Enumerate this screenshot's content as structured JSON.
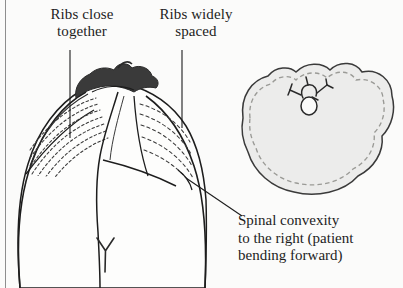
{
  "figure": {
    "kind": "medical-illustration",
    "background_color": "#fbfbfa",
    "ink_color": "#1d1d1d",
    "skin_fill": "#fdfdfc",
    "hair_color": "#3a3a3a",
    "inset_fill": "#ececeb",
    "dashed_line_color": "#9a9a96"
  },
  "labels": {
    "ribs_close": "Ribs close\ntogether",
    "ribs_wide": "Ribs widely\nspaced",
    "convexity": "Spinal convexity\nto the right (patient\nbending forward)"
  },
  "annotations": {
    "left_leader": "vertical leader line from 'Ribs close together' to left rib hump",
    "right_leader": "vertical leader line from 'Ribs widely spaced' to right flank ribs",
    "convexity_leader": "diagonal leader line from caption to spinal convexity on patient's right"
  },
  "torso": {
    "view": "posterior view from above, patient bent forward",
    "left_ribs_label": "closely spaced rib contour lines",
    "right_ribs_label": "widely spaced rib contour lines",
    "hair": "dark hair at crown of head",
    "gluteal_cleft": "Y-shaped cleft mark"
  },
  "inset": {
    "description": "transverse cross-section outline of trunk at rib hump level",
    "vertebra": "vertebra glyph with spinous and transverse processes",
    "contour": "solid outer contour with parallel dashed inner contour"
  }
}
